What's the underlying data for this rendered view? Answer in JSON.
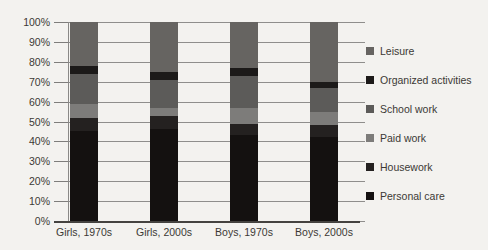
{
  "chart_data": {
    "type": "bar",
    "stacked": true,
    "percent_scale": true,
    "title": "",
    "xlabel": "",
    "ylabel": "",
    "categories": [
      "Girls, 1970s",
      "Girls, 2000s",
      "Boys, 1970s",
      "Boys, 2000s"
    ],
    "series": [
      {
        "name": "Personal care",
        "color": "#141110",
        "values": [
          45,
          46,
          43,
          42
        ]
      },
      {
        "name": "Housework",
        "color": "#242120",
        "values": [
          7,
          7,
          6,
          6
        ]
      },
      {
        "name": "Paid work",
        "color": "#7d7c7a",
        "values": [
          7,
          4,
          8,
          7
        ]
      },
      {
        "name": "School work",
        "color": "#5c5b59",
        "values": [
          15,
          14,
          16,
          12
        ]
      },
      {
        "name": "Organized activities",
        "color": "#1c1a19",
        "values": [
          4,
          4,
          4,
          3
        ]
      },
      {
        "name": "Leisure",
        "color": "#666461",
        "values": [
          22,
          25,
          23,
          30
        ]
      }
    ],
    "y_axis": {
      "min": 0,
      "max": 100,
      "step": 10,
      "tick_labels": [
        "0%",
        "10%",
        "20%",
        "30%",
        "40%",
        "50%",
        "60%",
        "70%",
        "80%",
        "90%",
        "100%"
      ]
    },
    "legend": {
      "position": "right",
      "labels_top_to_bottom": [
        "Leisure",
        "Organized activities",
        "School work",
        "Paid work",
        "Housework",
        "Personal care"
      ]
    },
    "grid": true
  },
  "colors": {
    "background": "#f3f2ef",
    "gridline": "#8f8e8c",
    "axis": "#454340",
    "text": "#3b3935"
  }
}
